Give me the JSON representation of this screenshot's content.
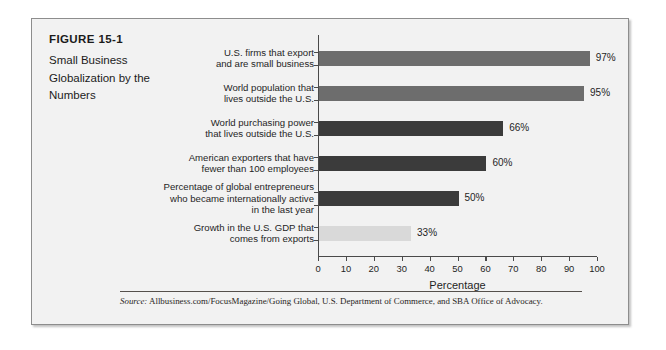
{
  "figure": {
    "number": "FIGURE 15-1",
    "title": "Small Business Globalization by the Numbers",
    "title_lines": [
      "Small Business",
      "Globalization by the",
      "Numbers"
    ]
  },
  "source": {
    "label": "Source:",
    "text": "Allbusiness.com/FocusMagazine/Going Global, U.S. Department of Commerce, and SBA Office of Advocacy."
  },
  "chart_data": {
    "type": "bar",
    "orientation": "horizontal",
    "title": "",
    "xlabel": "Percentage",
    "ylabel": "",
    "xlim": [
      0,
      100
    ],
    "xticks": [
      0,
      10,
      20,
      30,
      40,
      50,
      60,
      70,
      80,
      90,
      100
    ],
    "xticklabels": [
      "0",
      "10",
      "20",
      "30",
      "40",
      "50",
      "60",
      "70",
      "80",
      "90",
      "100"
    ],
    "grid": false,
    "legend": false,
    "categories": [
      "U.S. firms that export and are small business",
      "World population that lives outside the U.S.",
      "World purchasing power that lives outside the U.S.",
      "American exporters that have fewer than 100 employees",
      "Percentage of global entrepreneurs who became internationally active in the last year",
      "Growth in the U.S. GDP that comes from exports"
    ],
    "category_lines": [
      [
        "U.S. firms that export",
        "and are small business"
      ],
      [
        "World population that",
        "lives outside the U.S."
      ],
      [
        "World purchasing power",
        "that lives outside the U.S."
      ],
      [
        "American exporters that have",
        "fewer than 100 employees"
      ],
      [
        "Percentage of global entrepreneurs",
        "who became internationally active",
        "in the last year"
      ],
      [
        "Growth in the U.S. GDP that",
        "comes from exports"
      ]
    ],
    "values": [
      97,
      95,
      66,
      60,
      50,
      33
    ],
    "value_labels": [
      "97%",
      "95%",
      "66%",
      "60%",
      "50%",
      "33%"
    ],
    "bar_colors": [
      "#6d6d6d",
      "#6d6d6d",
      "#3b3b3b",
      "#3b3b3b",
      "#3b3b3b",
      "#d9d9d9"
    ]
  },
  "colors": {
    "panel_background": "#f2f2f2",
    "panel_border": "#8d8d8d",
    "axis": "#4a4a4a",
    "text": "#1f1f1f",
    "bar_medium": "#6d6d6d",
    "bar_dark": "#3b3b3b",
    "bar_light": "#d9d9d9"
  }
}
